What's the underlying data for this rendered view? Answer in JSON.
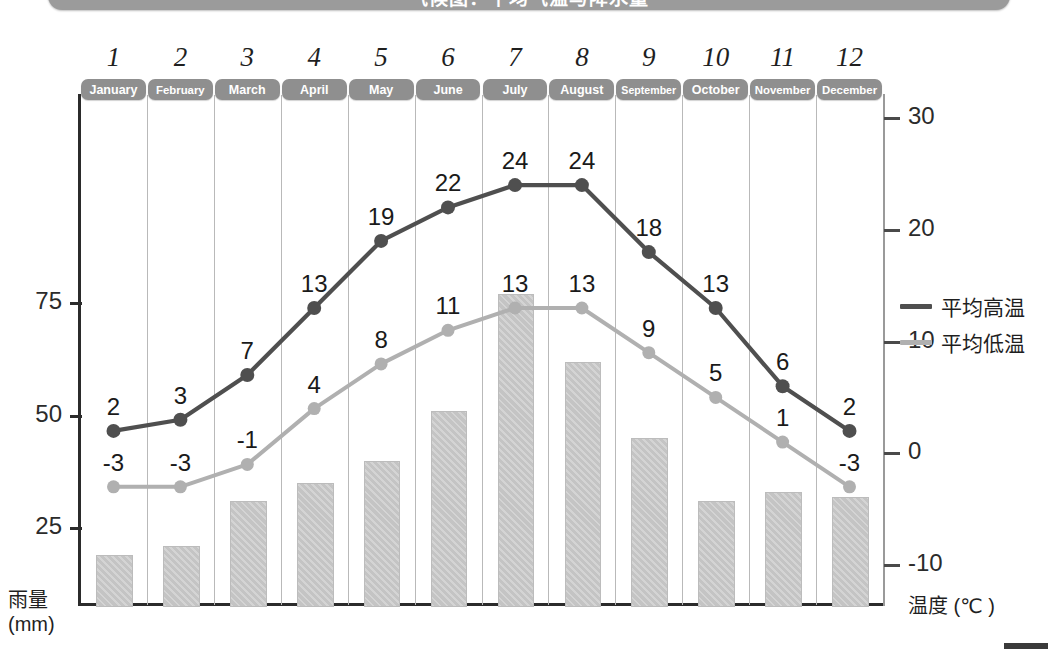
{
  "header": {
    "title": "气候图：平均气温与降水量"
  },
  "axes": {
    "left_label_line1": "雨量",
    "left_label_line2": "(mm)",
    "left_ticks": [
      "75",
      "50",
      "25"
    ],
    "right_label": "温度 (℃ )",
    "right_ticks": [
      "30",
      "20",
      "10",
      "0",
      "-10"
    ]
  },
  "legend": {
    "items": [
      {
        "label": "平均高温",
        "color": "#4f4f4f"
      },
      {
        "label": "平均低温",
        "color": "#b0b0b0"
      }
    ]
  },
  "months": {
    "numbers": [
      "1",
      "2",
      "3",
      "4",
      "5",
      "6",
      "7",
      "8",
      "9",
      "10",
      "11",
      "12"
    ],
    "names": [
      "January",
      "February",
      "March",
      "April",
      "May",
      "June",
      "July",
      "August",
      "September",
      "October",
      "November",
      "December"
    ]
  },
  "chart_data": {
    "type": "line",
    "title": "气候图：平均气温与降水量",
    "categories": [
      "1",
      "2",
      "3",
      "4",
      "5",
      "6",
      "7",
      "8",
      "9",
      "10",
      "11",
      "12"
    ],
    "category_names": [
      "January",
      "February",
      "March",
      "April",
      "May",
      "June",
      "July",
      "August",
      "September",
      "October",
      "November",
      "December"
    ],
    "xlabel": "",
    "ylabel": "雨量 (mm)",
    "y2label": "温度 (℃ )",
    "ylim": [
      0,
      90
    ],
    "y2lim": [
      -13,
      32
    ],
    "yticks": [
      25,
      50,
      75
    ],
    "y2ticks": [
      -10,
      0,
      10,
      20,
      30
    ],
    "grid": "vertical",
    "legend_position": "right",
    "series": [
      {
        "name": "平均高温",
        "type": "line",
        "axis": "right",
        "color": "#4f4f4f",
        "values": [
          2,
          3,
          7,
          13,
          19,
          22,
          24,
          24,
          18,
          13,
          6,
          2
        ],
        "labels": [
          "2",
          "3",
          "7",
          "13",
          "19",
          "22",
          "24",
          "24",
          "18",
          "13",
          "6",
          "2"
        ]
      },
      {
        "name": "平均低温",
        "type": "line",
        "axis": "right",
        "color": "#b0b0b0",
        "values": [
          -3,
          -3,
          -1,
          4,
          8,
          11,
          13,
          13,
          9,
          5,
          1,
          -3
        ],
        "labels": [
          "-3",
          "-3",
          "-1",
          "4",
          "8",
          "11",
          "13",
          "13",
          "9",
          "5",
          "1",
          "-3"
        ]
      },
      {
        "name": "降水量",
        "type": "bar",
        "axis": "left",
        "color": "#c4c4c4",
        "values": [
          19,
          21,
          31,
          35,
          40,
          51,
          77,
          62,
          45,
          31,
          33,
          32
        ]
      }
    ]
  }
}
